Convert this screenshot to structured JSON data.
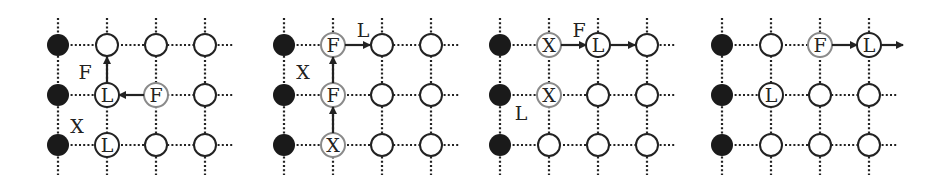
{
  "figure": {
    "colors": {
      "grid_line": "#222222",
      "node_stroke_dark": "#222222",
      "node_stroke_light": "#8a8a8a",
      "node_fill": "#ffffff",
      "filled_node": "#1a1a1a",
      "arrow": "#222222",
      "text": "#222222"
    },
    "panels": [
      {
        "id": "panel-1",
        "filled_column": 0,
        "nodes": [
          {
            "col": 1,
            "row": 1,
            "label": "L",
            "style": "dark"
          },
          {
            "col": 2,
            "row": 1,
            "label": "F",
            "style": "light"
          },
          {
            "col": 1,
            "row": 2,
            "label": "L",
            "style": "dark"
          }
        ],
        "arrows": [
          {
            "from": [
              1,
              1
            ],
            "to": [
              1,
              0
            ]
          },
          {
            "from": [
              2,
              1
            ],
            "to": [
              1,
              1
            ]
          }
        ],
        "annotations": [
          {
            "text": "F",
            "near": "left-of-arrow-1-up"
          },
          {
            "text": "X",
            "near": "left-of-node-1-2"
          }
        ]
      },
      {
        "id": "panel-2",
        "filled_column": 0,
        "nodes": [
          {
            "col": 1,
            "row": 0,
            "label": "F",
            "style": "light"
          },
          {
            "col": 1,
            "row": 1,
            "label": "F",
            "style": "light"
          },
          {
            "col": 1,
            "row": 2,
            "label": "X",
            "style": "light"
          }
        ],
        "arrows": [
          {
            "from": [
              1,
              2
            ],
            "to": [
              1,
              1
            ]
          },
          {
            "from": [
              1,
              1
            ],
            "to": [
              1,
              0
            ]
          },
          {
            "from": [
              1,
              0
            ],
            "to": [
              2,
              0
            ]
          }
        ],
        "annotations": [
          {
            "text": "X",
            "near": "left-of-arrow-1-up"
          },
          {
            "text": "L",
            "near": "above-arrow-right"
          }
        ]
      },
      {
        "id": "panel-3",
        "filled_column": 0,
        "nodes": [
          {
            "col": 1,
            "row": 0,
            "label": "X",
            "style": "light"
          },
          {
            "col": 2,
            "row": 0,
            "label": "L",
            "style": "dark"
          },
          {
            "col": 1,
            "row": 1,
            "label": "X",
            "style": "light"
          }
        ],
        "arrows": [
          {
            "from": [
              1,
              0
            ],
            "to": [
              2,
              0
            ]
          },
          {
            "from": [
              2,
              0
            ],
            "to": [
              3,
              0
            ]
          }
        ],
        "annotations": [
          {
            "text": "F",
            "near": "above-arrow-right"
          },
          {
            "text": "L",
            "near": "below-left-node-1-1"
          }
        ]
      },
      {
        "id": "panel-4",
        "filled_column": 0,
        "nodes": [
          {
            "col": 2,
            "row": 0,
            "label": "F",
            "style": "light"
          },
          {
            "col": 3,
            "row": 0,
            "label": "L",
            "style": "dark"
          },
          {
            "col": 1,
            "row": 1,
            "label": "L",
            "style": "dark"
          }
        ],
        "arrows": [
          {
            "from": [
              2,
              0
            ],
            "to": [
              3,
              0
            ]
          },
          {
            "from": [
              3,
              0
            ],
            "to": [
              4,
              0
            ]
          }
        ],
        "annotations": []
      }
    ]
  }
}
